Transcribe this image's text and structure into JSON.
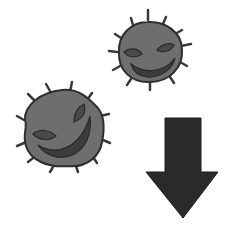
{
  "image": {
    "description": "Clipart illustration: two grinning germ cartoons and a downward arrow",
    "elements": [
      {
        "name": "small-germ",
        "kind": "germ-icon"
      },
      {
        "name": "large-germ",
        "kind": "germ-icon"
      },
      {
        "name": "down-arrow",
        "kind": "arrow-down-icon"
      }
    ],
    "colors": {
      "germ_body": "#6e6e6e",
      "germ_outline": "#2e2e2e",
      "germ_features": "#3c3c3c",
      "arrow": "#2a2a2a",
      "background": "#ffffff"
    }
  }
}
